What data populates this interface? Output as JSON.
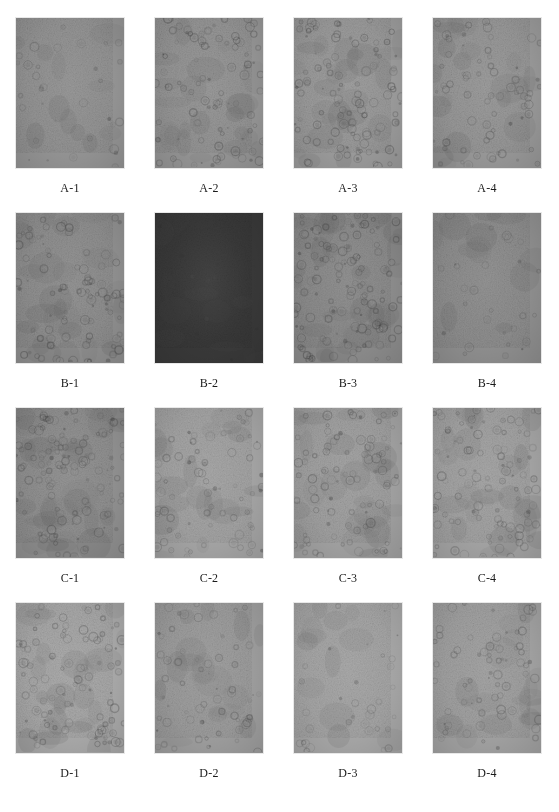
{
  "figure": {
    "type": "micrograph-panel-grid",
    "rows": 4,
    "columns": 4,
    "background_color": "#ffffff",
    "caption_color": "#1a1a1a",
    "panel_width_px": 110,
    "panel_height_px": 152
  },
  "panels": [
    {
      "label": "A-1",
      "row": "A",
      "column": 1,
      "base_color": "#939393",
      "grain_color": "#6f6f6f",
      "cell_density": "low",
      "cell_count": 26,
      "cell_opacity": 0.22,
      "brightness": "medium",
      "seed": 11
    },
    {
      "label": "A-2",
      "row": "A",
      "column": 2,
      "base_color": "#949494",
      "grain_color": "#6d6d6d",
      "cell_density": "high",
      "cell_count": 74,
      "cell_opacity": 0.3,
      "brightness": "medium",
      "seed": 23
    },
    {
      "label": "A-3",
      "row": "A",
      "column": 3,
      "base_color": "#9a9a9a",
      "grain_color": "#717171",
      "cell_density": "high",
      "cell_count": 88,
      "cell_opacity": 0.3,
      "brightness": "medium-light",
      "seed": 37
    },
    {
      "label": "A-4",
      "row": "A",
      "column": 4,
      "base_color": "#979797",
      "grain_color": "#707070",
      "cell_density": "medium",
      "cell_count": 58,
      "cell_opacity": 0.26,
      "brightness": "medium",
      "seed": 41
    },
    {
      "label": "B-1",
      "row": "B",
      "column": 1,
      "base_color": "#8e8e8e",
      "grain_color": "#686868",
      "cell_density": "high",
      "cell_count": 78,
      "cell_opacity": 0.3,
      "brightness": "medium",
      "seed": 53
    },
    {
      "label": "B-2",
      "row": "B",
      "column": 2,
      "base_color": "#383838",
      "grain_color": "#1e1e1e",
      "cell_density": "low",
      "cell_count": 30,
      "cell_opacity": 0.22,
      "brightness": "dark",
      "seed": 67
    },
    {
      "label": "B-3",
      "row": "B",
      "column": 3,
      "base_color": "#8b8b8b",
      "grain_color": "#636363",
      "cell_density": "very-high",
      "cell_count": 110,
      "cell_opacity": 0.3,
      "brightness": "medium-dark",
      "seed": 71
    },
    {
      "label": "B-4",
      "row": "B",
      "column": 4,
      "base_color": "#8d8d8d",
      "grain_color": "#676767",
      "cell_density": "low",
      "cell_count": 24,
      "cell_opacity": 0.2,
      "brightness": "medium-dark",
      "seed": 83
    },
    {
      "label": "C-1",
      "row": "C",
      "column": 1,
      "base_color": "#abab ab",
      "grain_color": "#838383",
      "cell_density": "very-high",
      "cell_count": 104,
      "cell_opacity": 0.26,
      "brightness": "light",
      "seed": 97
    },
    {
      "label": "C-2",
      "row": "C",
      "column": 2,
      "base_color": "#a3a3a3",
      "grain_color": "#7c7c7c",
      "cell_density": "medium",
      "cell_count": 60,
      "cell_opacity": 0.24,
      "brightness": "light",
      "seed": 103
    },
    {
      "label": "C-3",
      "row": "C",
      "column": 3,
      "base_color": "#a0a0a0",
      "grain_color": "#787878",
      "cell_density": "high",
      "cell_count": 80,
      "cell_opacity": 0.26,
      "brightness": "light",
      "seed": 113
    },
    {
      "label": "C-4",
      "row": "C",
      "column": 4,
      "base_color": "#a2a2a2",
      "grain_color": "#7a7a7a",
      "cell_density": "high",
      "cell_count": 86,
      "cell_opacity": 0.26,
      "brightness": "light",
      "seed": 127
    },
    {
      "label": "D-1",
      "row": "D",
      "column": 1,
      "base_color": "#a7a7a7",
      "grain_color": "#808080",
      "cell_density": "high",
      "cell_count": 82,
      "cell_opacity": 0.26,
      "brightness": "light",
      "seed": 131
    },
    {
      "label": "D-2",
      "row": "D",
      "column": 2,
      "base_color": "#9c9c9c",
      "grain_color": "#767676",
      "cell_density": "medium",
      "cell_count": 52,
      "cell_opacity": 0.24,
      "brightness": "medium-light",
      "seed": 139
    },
    {
      "label": "D-3",
      "row": "D",
      "column": 3,
      "base_color": "#a5a5a5",
      "grain_color": "#7e7e7e",
      "cell_density": "low",
      "cell_count": 28,
      "cell_opacity": 0.2,
      "brightness": "light",
      "seed": 149
    },
    {
      "label": "D-4",
      "row": "D",
      "column": 4,
      "base_color": "#a0a0a0",
      "grain_color": "#797979",
      "cell_density": "medium",
      "cell_count": 56,
      "cell_opacity": 0.24,
      "brightness": "light",
      "seed": 151
    }
  ]
}
